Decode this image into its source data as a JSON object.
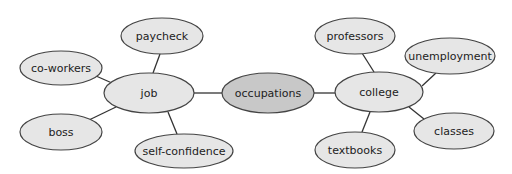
{
  "diagram": {
    "type": "concept-web",
    "center": {
      "id": "occupations",
      "label": "occupations",
      "cx": 268,
      "cy": 93,
      "rx": 46,
      "ry": 20,
      "fill": "#c8c8c8"
    },
    "nodes": [
      {
        "id": "job",
        "label": "job",
        "cx": 149,
        "cy": 93,
        "rx": 45,
        "ry": 20
      },
      {
        "id": "paycheck",
        "label": "paycheck",
        "cx": 162,
        "cy": 36,
        "rx": 41,
        "ry": 18
      },
      {
        "id": "co-workers",
        "label": "co-workers",
        "cx": 61,
        "cy": 68,
        "rx": 41,
        "ry": 17
      },
      {
        "id": "boss",
        "label": "boss",
        "cx": 61,
        "cy": 132,
        "rx": 41,
        "ry": 18
      },
      {
        "id": "self-confidence",
        "label": "self-confidence",
        "cx": 184,
        "cy": 151,
        "rx": 49,
        "ry": 17
      },
      {
        "id": "college",
        "label": "college",
        "cx": 379,
        "cy": 92,
        "rx": 44,
        "ry": 20
      },
      {
        "id": "professors",
        "label": "professors",
        "cx": 355,
        "cy": 36,
        "rx": 40,
        "ry": 18
      },
      {
        "id": "unemployment",
        "label": "unemployment",
        "cx": 450,
        "cy": 56,
        "rx": 45,
        "ry": 18
      },
      {
        "id": "classes",
        "label": "classes",
        "cx": 454,
        "cy": 131,
        "rx": 40,
        "ry": 18
      },
      {
        "id": "textbooks",
        "label": "textbooks",
        "cx": 355,
        "cy": 150,
        "rx": 40,
        "ry": 18
      }
    ],
    "edges": [
      {
        "from": "occupations",
        "to": "job",
        "x1": 222,
        "y1": 93,
        "x2": 194,
        "y2": 93
      },
      {
        "from": "occupations",
        "to": "college",
        "x1": 314,
        "y1": 93,
        "x2": 335,
        "y2": 93
      },
      {
        "from": "job",
        "to": "paycheck",
        "x1": 153,
        "y1": 73,
        "x2": 160,
        "y2": 54
      },
      {
        "from": "job",
        "to": "co-workers",
        "x1": 112,
        "y1": 83,
        "x2": 96,
        "y2": 76
      },
      {
        "from": "job",
        "to": "boss",
        "x1": 116,
        "y1": 107,
        "x2": 89,
        "y2": 120
      },
      {
        "from": "job",
        "to": "self-confidence",
        "x1": 168,
        "y1": 112,
        "x2": 177,
        "y2": 134
      },
      {
        "from": "college",
        "to": "professors",
        "x1": 374,
        "y1": 72,
        "x2": 362,
        "y2": 53
      },
      {
        "from": "college",
        "to": "unemployment",
        "x1": 422,
        "y1": 86,
        "x2": 436,
        "y2": 73
      },
      {
        "from": "college",
        "to": "classes",
        "x1": 409,
        "y1": 107,
        "x2": 424,
        "y2": 119
      },
      {
        "from": "college",
        "to": "textbooks",
        "x1": 370,
        "y1": 112,
        "x2": 362,
        "y2": 132
      }
    ]
  }
}
